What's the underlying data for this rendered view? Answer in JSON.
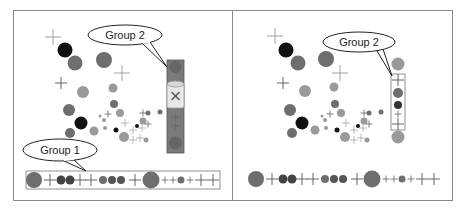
{
  "panels": [
    {
      "id": "before",
      "callouts": [
        {
          "label": "Group 2",
          "target": "column-group"
        },
        {
          "label": "Group 1",
          "target": "row-group"
        }
      ],
      "column_group": {
        "state": "being-deleted",
        "icon": "trash-can-x-icon"
      }
    },
    {
      "id": "after",
      "callouts": [
        {
          "label": "Group 2",
          "target": "column-group"
        }
      ]
    }
  ],
  "colors": {
    "border": "#8a8a8a",
    "dark_marker": "#111111",
    "mid_marker": "#6e6e6e",
    "light_marker": "#9a9a9a",
    "cross": "#777777",
    "selection_fill": "#7a7a7a"
  }
}
